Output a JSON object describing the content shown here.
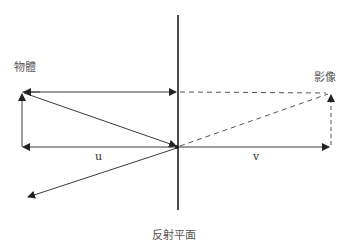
{
  "labels": {
    "object": "物體",
    "image": "影像",
    "mirror": "反射平面",
    "object_distance": "u",
    "image_distance": "v"
  },
  "colors": {
    "line": "#3a3a3a",
    "mirror": "#222222",
    "dashed": "#555555",
    "text": "#555555"
  },
  "geometry": {
    "mirror_x": 178,
    "mirror_y_range": [
      15,
      210
    ],
    "object": {
      "x": 22,
      "base_y": 147,
      "top_y": 92
    },
    "image": {
      "x": 331,
      "base_y": 147,
      "top_y": 93
    },
    "axis_y": 147,
    "reflected_ray_end": [
      28,
      197
    ]
  }
}
